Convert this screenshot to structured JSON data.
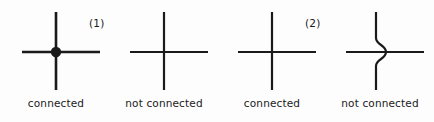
{
  "figure": {
    "background_color": "#fdfdfd",
    "ink_color": "#1a1a1a",
    "groups": [
      {
        "label": "(1)",
        "items": [
          {
            "caption": "connected",
            "symbol": "cross-with-dot",
            "junction_dot": true,
            "jog": false
          },
          {
            "caption": "not connected",
            "symbol": "plain-cross",
            "junction_dot": false,
            "jog": false
          }
        ]
      },
      {
        "label": "(2)",
        "items": [
          {
            "caption": "connected",
            "symbol": "plain-cross",
            "junction_dot": false,
            "jog": false
          },
          {
            "caption": "not connected",
            "symbol": "cross-with-jog",
            "junction_dot": false,
            "jog": true
          }
        ]
      }
    ]
  }
}
